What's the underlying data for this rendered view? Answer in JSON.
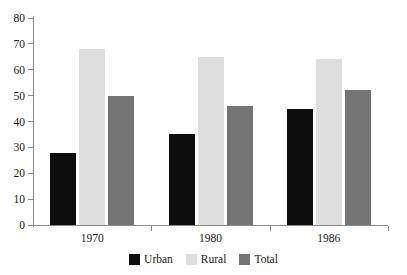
{
  "chart_data": {
    "type": "bar",
    "title": "",
    "subtitle": "",
    "xlabel": "",
    "ylabel": "",
    "categories": [
      "1970",
      "1980",
      "1986"
    ],
    "series": [
      {
        "name": "Urban",
        "color": "#0d0d0d",
        "values": [
          28,
          35,
          45
        ]
      },
      {
        "name": "Rural",
        "color": "#dedede",
        "values": [
          68,
          65,
          64
        ]
      },
      {
        "name": "Total",
        "color": "#757575",
        "values": [
          50,
          46,
          52
        ]
      }
    ],
    "ylim": [
      0,
      80
    ],
    "yticks": [
      0,
      10,
      20,
      30,
      40,
      50,
      60,
      70,
      80
    ],
    "ytick_labels": [
      "0",
      "10",
      "20",
      "30",
      "40",
      "50",
      "60",
      "70",
      "80"
    ],
    "grid": false,
    "legend_position": "bottom"
  },
  "legend": {
    "items": [
      {
        "label": "Urban",
        "color": "#0d0d0d"
      },
      {
        "label": "Rural",
        "color": "#dedede"
      },
      {
        "label": "Total",
        "color": "#757575"
      }
    ]
  },
  "axis": {
    "axis_color": "#8a8a8a"
  }
}
